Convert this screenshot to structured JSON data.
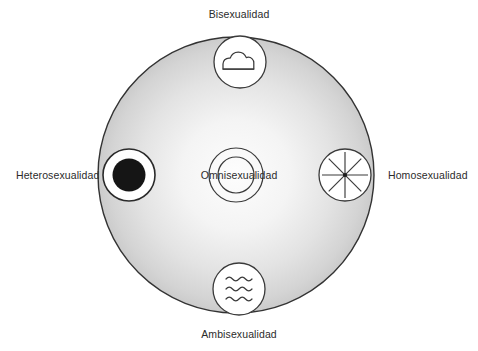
{
  "diagram": {
    "type": "radial-concept-diagram",
    "field_circle": {
      "name": "sexuality-spectrum-field",
      "fill_center_color": "#fdfdfd",
      "fill_edge_color": "#c9c9c9",
      "stroke_color": "#333333"
    },
    "center_node": {
      "id": "omnisexualidad",
      "label": "Omnisexualidad",
      "icon": "concentric-rings-icon",
      "position": "center"
    },
    "nodes": [
      {
        "id": "bisexualidad",
        "label": "Bisexualidad",
        "icon": "cloud-icon",
        "position": "top",
        "label_position": "above"
      },
      {
        "id": "heterosexualidad",
        "label": "Heterosexualidad",
        "icon": "filled-dot-icon",
        "position": "left",
        "label_position": "left"
      },
      {
        "id": "homosexualidad",
        "label": "Homosexualidad",
        "icon": "asterisk-starburst-icon",
        "position": "right",
        "label_position": "right"
      },
      {
        "id": "ambisexualidad",
        "label": "Ambisexualidad",
        "icon": "waves-icon",
        "position": "bottom",
        "label_position": "below"
      }
    ],
    "colors": {
      "ink": "#2b2b2b",
      "stroke": "#333333",
      "node_fill": "#ffffff",
      "dot_fill": "#151515"
    }
  }
}
